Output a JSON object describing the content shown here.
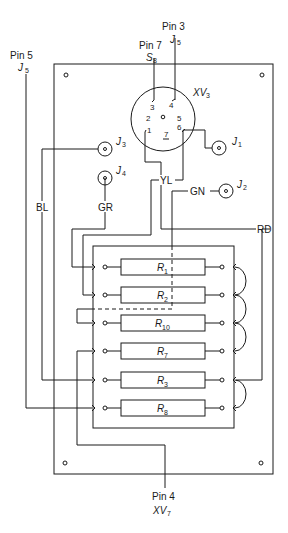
{
  "diagram": {
    "type": "wiring-diagram",
    "external_labels": {
      "pin3": {
        "line1": "Pin 3",
        "line2_main": "J",
        "line2_sub": "5"
      },
      "pin7": {
        "line1": "Pin 7",
        "line2_main": "S",
        "line2_sub": "8"
      },
      "pin5": {
        "line1": "Pin 5",
        "line2_main": "J",
        "line2_sub": "5"
      },
      "pin4": {
        "line1": "Pin 4",
        "line2_main": "XV",
        "line2_sub": "7"
      }
    },
    "socket": {
      "label_main": "XV",
      "label_sub": "3",
      "pins": [
        "1",
        "2",
        "3",
        "4",
        "5",
        "6",
        "7"
      ]
    },
    "jacks": [
      {
        "id": "J1",
        "main": "J",
        "sub": "1"
      },
      {
        "id": "J2",
        "main": "J",
        "sub": "2"
      },
      {
        "id": "J3",
        "main": "J",
        "sub": "3"
      },
      {
        "id": "J4",
        "main": "J",
        "sub": "4"
      }
    ],
    "wire_colors": {
      "bl": "BL",
      "gr": "GR",
      "yl": "YL",
      "gn": "GN",
      "rd": "RD"
    },
    "resistors": [
      {
        "main": "R",
        "sub": "1"
      },
      {
        "main": "R",
        "sub": "2"
      },
      {
        "main": "R",
        "sub": "10"
      },
      {
        "main": "R",
        "sub": "7"
      },
      {
        "main": "R",
        "sub": "3"
      },
      {
        "main": "R",
        "sub": "8"
      }
    ],
    "line_color": "#1a1a1a",
    "background": "#ffffff"
  }
}
